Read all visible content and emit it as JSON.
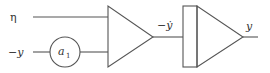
{
  "diagram": {
    "type": "block-diagram",
    "inputs": [
      {
        "label": "η",
        "role": "input-top"
      },
      {
        "label": "−y",
        "role": "input-bottom"
      }
    ],
    "gain_block": {
      "label": "a",
      "subscript": "1",
      "shape": "circle"
    },
    "summing_amplifier": {
      "shape": "triangle"
    },
    "intermediate_signal": {
      "label": "−ẏ"
    },
    "integrator": {
      "shape": "rect-triangle"
    },
    "output": {
      "label": "y"
    }
  },
  "colors": {
    "line": "#555555",
    "text": "#333333",
    "background": "#ffffff"
  }
}
